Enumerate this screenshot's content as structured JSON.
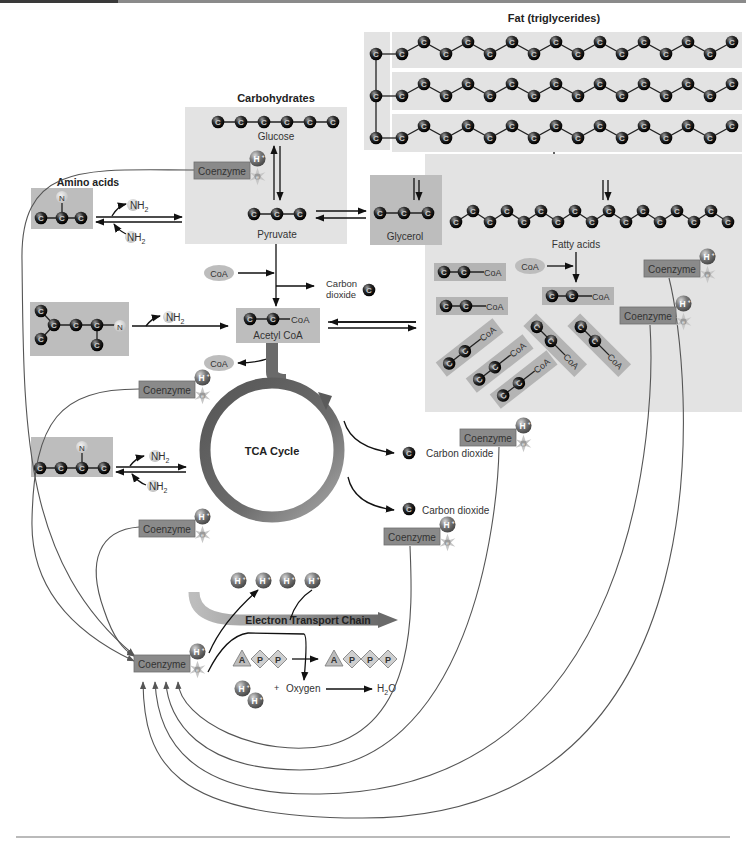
{
  "title_labels": {
    "carbohydrates": "Carbohydrates",
    "fat": "Fat (triglycerides)",
    "amino_acids": "Amino acids",
    "tca": "TCA Cycle",
    "etc": "Electron Transport Chain"
  },
  "molecules": {
    "glucose": "Glucose",
    "pyruvate": "Pyruvate",
    "glycerol": "Glycerol",
    "fatty_acids": "Fatty acids",
    "acetyl_coa": "Acetyl CoA",
    "coa": "CoA",
    "carbon_dioxide": "Carbon dioxide",
    "carbon": "Carbon",
    "dioxide": "dioxide",
    "nh2_n": "N",
    "nh2_h": "H",
    "nh2_sub": "2",
    "n": "N",
    "c": "C",
    "oxygen": "Oxygen",
    "plus": "+",
    "water_h": "H",
    "water_sub": "2",
    "water_o": "O"
  },
  "coenzyme": {
    "label": "Coenzyme",
    "proton": "H+",
    "electron": "e-"
  },
  "atp": {
    "adp": [
      "A",
      "P",
      "P"
    ],
    "atp": [
      "A",
      "P",
      "P",
      "P"
    ]
  },
  "colors": {
    "panel": "#e3e3e3",
    "box": "#bdbdbd",
    "coenzyme": "#8a8a8a",
    "carbon_atom": "#1a1a1a",
    "tca_ring": "#6a6a6a",
    "etc_arrow": "#7a7a7a"
  }
}
